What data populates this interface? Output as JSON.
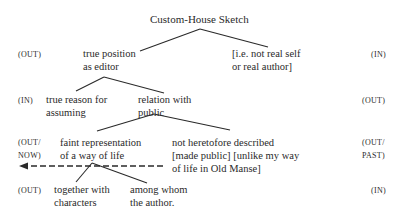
{
  "title": "Custom-House Sketch",
  "rows": [
    {
      "left_tag": "(OUT)",
      "right_tag": "(IN)",
      "nodes": [
        {
          "line1": "true position",
          "line2": "as editor"
        },
        {
          "line1": "[i.e. not real self",
          "line2": "or real author]"
        }
      ]
    },
    {
      "left_tag": "(IN)",
      "right_tag": "(OUT)",
      "nodes": [
        {
          "line1": "true reason for",
          "line2": "assuming"
        },
        {
          "line1": "relation with",
          "line2": "public"
        }
      ]
    },
    {
      "left_tag_line1": "(OUT/",
      "left_tag_line2": "NOW)",
      "right_tag_line1": "(OUT/",
      "right_tag_line2": "PAST)",
      "nodes": [
        {
          "line1": "faint representation",
          "line2": "of a way of life"
        },
        {
          "line1": "not heretofore described",
          "line2": "[made public] [unlike my way",
          "line3": "of life in Old Manse]"
        }
      ]
    },
    {
      "left_tag": "(OUT)",
      "right_tag": "(IN)",
      "nodes": [
        {
          "line1": "together with",
          "line2": "characters"
        },
        {
          "line1": "among whom",
          "line2": "the author."
        }
      ]
    }
  ],
  "arrow": {
    "style": "dashed",
    "direction": "left",
    "from": "not heretofore described",
    "to": "(OUT/ NOW)"
  },
  "colors": {
    "ink": "#2a2a2a",
    "background": "#ffffff"
  }
}
